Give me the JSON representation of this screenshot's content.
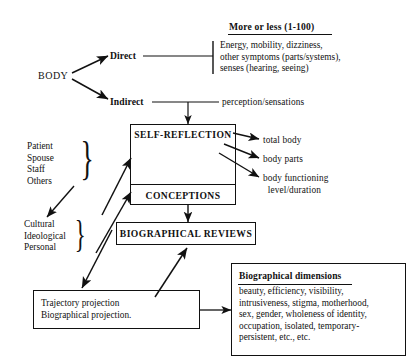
{
  "diagram": {
    "title_note": "More or less (1-100)",
    "source_label": "BODY",
    "branches": [
      {
        "label": "Direct"
      },
      {
        "label": "Indirect"
      }
    ],
    "direct_detail": "Energy, mobility, dizziness,\nother symptoms (parts/systems),\nsenses (hearing, seeing)",
    "indirect_detail": "perception/sensations",
    "boxes": [
      {
        "name": "self-reflection",
        "label": "SELF-REFLECTION"
      },
      {
        "name": "conceptions",
        "label": "CONCEPTIONS"
      },
      {
        "name": "biographical-reviews",
        "label": "BIOGRAPHICAL REVIEWS"
      },
      {
        "name": "trajectory-projection",
        "label": "Trajectory projection\nBiographical projection."
      }
    ],
    "outputs": [
      {
        "label": "total body"
      },
      {
        "label": "body parts"
      },
      {
        "label": "body functioning\n  level/duration"
      }
    ],
    "influence_groups": [
      {
        "name": "persons",
        "items": "Patient\nSpouse\nStaff\nOthers"
      },
      {
        "name": "contexts",
        "items": "Cultural\nIdeological\nPersonal"
      }
    ],
    "dimensions_panel": {
      "heading": "Biographical dimensions",
      "body": "beauty, efficiency, visibility,\nintrusiveness, stigma, motherhood,\nsex, gender, wholeness of identity,\noccupation, isolated, temporary-\npersistent, etc., etc."
    },
    "colors": {
      "ink": "#111111",
      "background": "#ffffff"
    }
  }
}
